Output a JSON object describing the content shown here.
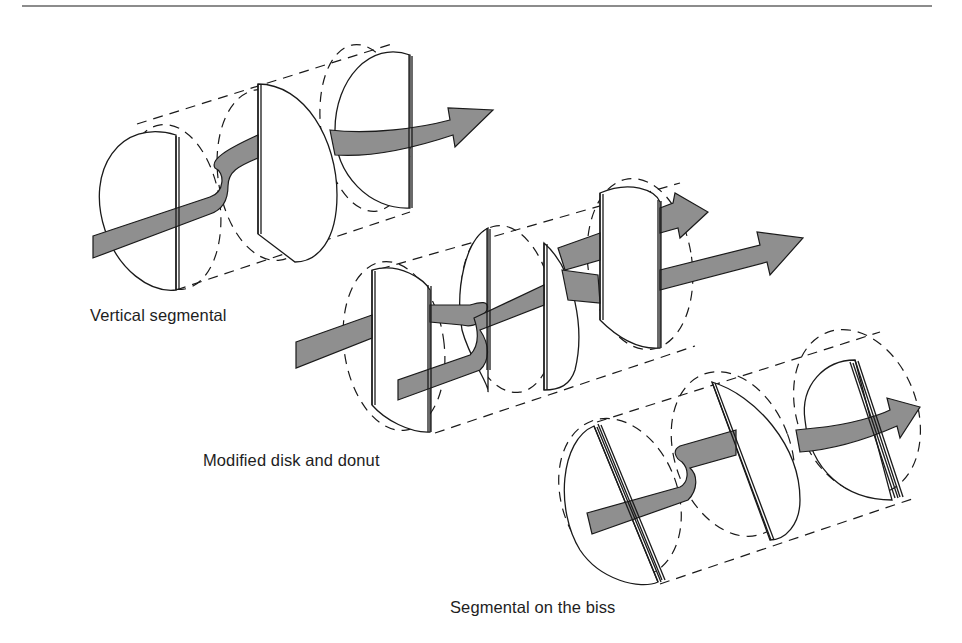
{
  "figure": {
    "flow_fill_color": "#8f8f8f",
    "rule_color": "#8c8c8c",
    "line_color": "#1a1a1a",
    "background": "#ffffff"
  },
  "captions": {
    "vertical_segmental": "Vertical segmental",
    "modified_disk_and_donut": "Modified disk and  donut",
    "segmental_on_bias": "Segmental on the biss"
  },
  "diagrams": [
    {
      "id": "vertical-segmental",
      "caption_key": "vertical_segmental",
      "cylinder_edges": [
        "M137,124 L392,44",
        "M176,290 L410,212"
      ],
      "dashed_ellipses": [
        {
          "cx": 172,
          "cy": 207,
          "rx": 48,
          "ry": 83,
          "rot": -8
        },
        {
          "cx": 268,
          "cy": 175,
          "rx": 50,
          "ry": 86,
          "rot": -8
        },
        {
          "cx": 365,
          "cy": 128,
          "rx": 44,
          "ry": 84,
          "rot": -8
        }
      ],
      "disks": [
        {
          "path": "M176,135 C120,118 85,170 105,230 C118,270 150,293 176,290 Z"
        },
        {
          "path": "M258,84 C305,84 337,140 337,195 C337,240 318,262 295,262 L258,234 Z"
        },
        {
          "path": "M410,55 C370,40 335,80 335,130 C335,175 370,210 410,208 Z"
        }
      ],
      "baffles": [
        {
          "x1": 176,
          "y1": 136,
          "x2": 176,
          "y2": 290
        },
        {
          "x1": 258,
          "y1": 84,
          "x2": 258,
          "y2": 234
        },
        {
          "x1": 409,
          "y1": 55,
          "x2": 409,
          "y2": 208
        }
      ],
      "flows": [
        "M93,236 L210,197 C225,192 225,172 215,168 C210,160 225,150 258,135 L258,158 C238,166 228,172 228,186 C228,200 222,210 210,214 L93,258 Z",
        "M330,130 C370,135 420,128 450,120 L448,108 L493,110 L455,147 L453,135 C420,146 375,158 335,155 Z"
      ]
    },
    {
      "id": "modified-disk-donut",
      "caption_key": "modified_disk_and_donut",
      "cylinder_edges": [
        "M380,269 L680,183",
        "M435,433 L695,346"
      ],
      "dashed_ellipses": [
        {
          "cx": 394,
          "cy": 346,
          "rx": 50,
          "ry": 85,
          "rot": -8
        },
        {
          "cx": 508,
          "cy": 309,
          "rx": 46,
          "ry": 84,
          "rot": -8
        },
        {
          "cx": 640,
          "cy": 264,
          "rx": 52,
          "ry": 86,
          "rot": -8
        }
      ],
      "disks": [
        {
          "path": "M372,270 C400,262 425,280 430,290 L430,432 C410,433 385,420 372,405 Z"
        },
        {
          "path": "M488,228 C465,240 455,290 462,330 C470,360 490,385 488,392 Z"
        },
        {
          "path": "M544,243 C575,270 585,330 575,370 C570,385 560,390 544,390 Z"
        },
        {
          "path": "M600,193 C630,180 655,190 660,202 L660,348 C635,350 615,335 600,320 Z"
        }
      ],
      "baffles": [
        {
          "x1": 372,
          "y1": 270,
          "x2": 372,
          "y2": 405
        },
        {
          "x1": 428,
          "y1": 285,
          "x2": 428,
          "y2": 432
        },
        {
          "x1": 487,
          "y1": 228,
          "x2": 487,
          "y2": 370
        },
        {
          "x1": 544,
          "y1": 243,
          "x2": 544,
          "y2": 390
        },
        {
          "x1": 600,
          "y1": 193,
          "x2": 600,
          "y2": 320
        },
        {
          "x1": 658,
          "y1": 200,
          "x2": 658,
          "y2": 348
        }
      ],
      "flows": [
        "M296,342 L372,315 L372,338 L296,368 Z",
        "M430,305 L470,305 C480,302 490,300 487,310 L480,320 C478,325 470,327 462,325 L430,322 Z",
        "M474,318 L544,285 L544,305 L480,330 C490,345 490,360 480,370 L398,400 L398,380 L470,355 C480,345 478,330 474,318 Z",
        "M558,248 L600,233 L600,260 L565,270 Z",
        "M562,270 L598,275 L600,303 L568,300 Z",
        "M660,208 L673,203 L675,193 L708,212 L680,238 L678,228 L660,233 Z",
        "M660,270 L760,245 L757,232 L803,238 L770,275 L767,262 L660,290 Z"
      ]
    },
    {
      "id": "segmental-on-bias",
      "caption_key": "segmental_on_bias",
      "cylinder_edges": [
        "M597,422 L880,332",
        "M660,584 L915,498"
      ],
      "dashed_ellipses": [
        {
          "cx": 620,
          "cy": 498,
          "rx": 58,
          "ry": 82,
          "rot": -20
        },
        {
          "cx": 733,
          "cy": 454,
          "rx": 58,
          "ry": 85,
          "rot": -20
        },
        {
          "cx": 857,
          "cy": 412,
          "rx": 60,
          "ry": 85,
          "rot": -20
        }
      ],
      "disks": [
        {
          "path": "M594,426 C560,440 555,510 580,550 C600,580 640,590 658,582 Z"
        },
        {
          "path": "M712,382 C755,395 800,445 800,500 C800,525 785,540 770,540 Z"
        },
        {
          "path": "M855,360 C825,360 800,385 805,420 C810,470 845,500 892,500 Z"
        }
      ],
      "baffles": [
        {
          "x1": 594,
          "y1": 426,
          "x2": 658,
          "y2": 582
        },
        {
          "x1": 598,
          "y1": 424,
          "x2": 662,
          "y2": 580
        },
        {
          "x1": 712,
          "y1": 382,
          "x2": 771,
          "y2": 540
        },
        {
          "x1": 850,
          "y1": 362,
          "x2": 895,
          "y2": 498
        },
        {
          "x1": 855,
          "y1": 360,
          "x2": 900,
          "y2": 497
        }
      ],
      "flows": [
        "M587,513 L680,487 C688,483 690,470 682,462 C675,458 672,450 680,446 L736,430 L736,455 L690,468 C698,475 698,490 688,500 L592,534 Z",
        "M796,430 L815,428 C850,425 880,415 890,410 L887,398 L920,407 L900,438 L897,426 C865,440 830,450 800,452 Z"
      ]
    }
  ]
}
